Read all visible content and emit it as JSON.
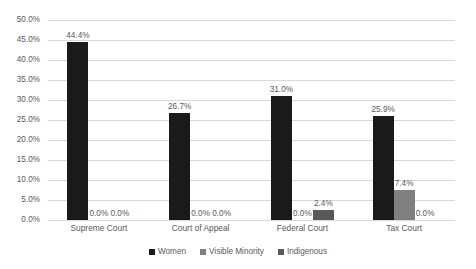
{
  "chart_data": {
    "type": "bar",
    "title": "",
    "subtitle": "",
    "xlabel": "",
    "ylabel": "",
    "categories": [
      "Supreme Court",
      "Court of Appeal",
      "Federal Court",
      "Tax Court"
    ],
    "series": [
      {
        "name": "Women",
        "color": "#1a1a1a",
        "values": [
          44.4,
          26.7,
          31.0,
          25.9
        ],
        "labels": [
          "44.4%",
          "26.7%",
          "31.0%",
          "25.9%"
        ]
      },
      {
        "name": "Visible Minority",
        "color": "#808080",
        "values": [
          0.0,
          0.0,
          0.0,
          7.4
        ],
        "labels": [
          "0.0%",
          "0.0%",
          "0.0%",
          "7.4%"
        ]
      },
      {
        "name": "Indigenous",
        "color": "#595959",
        "values": [
          0.0,
          0.0,
          2.4,
          0.0
        ],
        "labels": [
          "0.0%",
          "0.0%",
          "2.4%",
          "0.0%"
        ]
      }
    ],
    "ylim": [
      0,
      50
    ],
    "ytick_values": [
      0,
      5,
      10,
      15,
      20,
      25,
      30,
      35,
      40,
      45,
      50
    ],
    "ytick_labels": [
      "0.0%",
      "5.0%",
      "10.0%",
      "15.0%",
      "20.0%",
      "25.0%",
      "30.0%",
      "35.0%",
      "40.0%",
      "45.0%",
      "50.0%"
    ],
    "grid": true,
    "legend_position": "bottom",
    "data_labels": true
  },
  "legend": {
    "items": [
      {
        "label": "Women"
      },
      {
        "label": "Visible Minority"
      },
      {
        "label": "Indigenous"
      }
    ]
  }
}
